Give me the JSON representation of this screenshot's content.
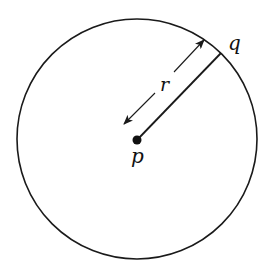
{
  "diagram": {
    "circle": {
      "cx": 137,
      "cy": 139,
      "r": 120,
      "stroke": "#1a1a1a"
    },
    "center_point": {
      "label": "p",
      "x": 137,
      "y": 140
    },
    "boundary_point": {
      "label": "q",
      "x": 221,
      "y": 53
    },
    "radius_label": "r",
    "colors": {
      "ink": "#1a1a1a",
      "background": "#ffffff"
    }
  }
}
